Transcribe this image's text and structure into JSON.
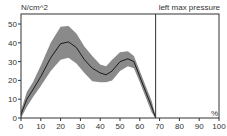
{
  "chart_data": {
    "type": "area",
    "title": "left max pressure",
    "ylabel": "N/cm^2",
    "xlabel": "%",
    "xlim": [
      0,
      100
    ],
    "ylim": [
      0,
      55
    ],
    "x_ticks": [
      0,
      10,
      20,
      30,
      40,
      50,
      60,
      70,
      80,
      90,
      100
    ],
    "y_ticks": [
      0,
      10,
      20,
      30,
      40,
      50
    ],
    "grid": false,
    "divider_x": 68,
    "x": [
      0,
      3,
      6,
      10,
      15,
      20,
      24,
      28,
      32,
      36,
      40,
      43,
      46,
      50,
      54,
      57,
      60,
      63,
      66,
      68
    ],
    "series": [
      {
        "name": "mean",
        "values": [
          2,
          10,
          15,
          22,
          32,
          39.5,
          40.5,
          37.5,
          31,
          26.5,
          24,
          23,
          25,
          30,
          31.5,
          30,
          22,
          14,
          6,
          0
        ]
      },
      {
        "name": "upper",
        "values": [
          4,
          14,
          19,
          28,
          40,
          48.5,
          49,
          45,
          38,
          33,
          28.5,
          27.5,
          31,
          35,
          35.5,
          33,
          25,
          17,
          9,
          1
        ]
      },
      {
        "name": "lower",
        "values": [
          0,
          6,
          11,
          17,
          25,
          31,
          32,
          29,
          24,
          19.5,
          19,
          19,
          20,
          25,
          27.5,
          26.5,
          19,
          11,
          3,
          0
        ]
      }
    ]
  },
  "labels": {
    "y_unit": "N/cm^2",
    "title": "left max pressure",
    "x_unit": "%"
  },
  "colors": {
    "band": "#8a8a8a",
    "line": "#1a1a1a",
    "axis": "#333333"
  }
}
